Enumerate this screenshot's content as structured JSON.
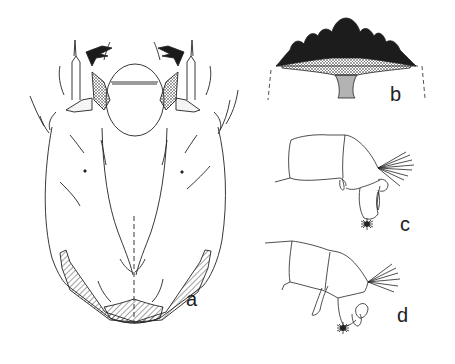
{
  "figure": {
    "panels": [
      {
        "id": "a",
        "label": "a",
        "subject": "head capsule, dorsal view"
      },
      {
        "id": "b",
        "label": "b",
        "subject": "mentum"
      },
      {
        "id": "c",
        "label": "c",
        "subject": "antenna / appendage, lateral view"
      },
      {
        "id": "d",
        "label": "d",
        "subject": "antenna / appendage, lateral view"
      }
    ],
    "colors": {
      "ink": "#222222",
      "background": "#ffffff"
    }
  }
}
